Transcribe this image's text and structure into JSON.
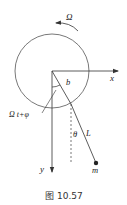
{
  "diagram": {
    "labels": {
      "omega": "Ω",
      "x_axis": "x",
      "y_axis": "y",
      "radius": "b",
      "angle_phase": "Ω t+φ",
      "theta": "θ",
      "length": "L",
      "mass": "m"
    },
    "caption": "图 10.57",
    "colors": {
      "stroke": "#333333",
      "background": "#ffffff"
    }
  }
}
